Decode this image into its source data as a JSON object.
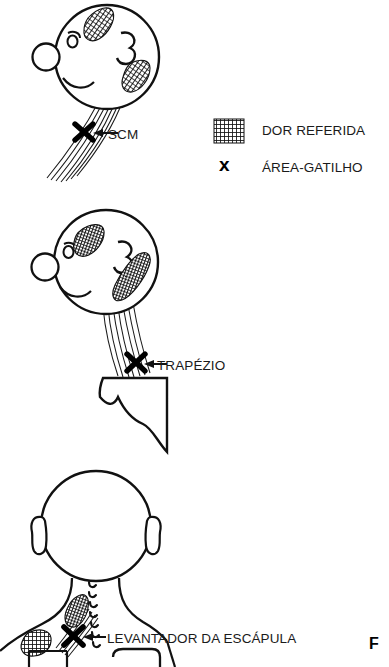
{
  "plate": {
    "letter": "F"
  },
  "legend": {
    "items": [
      {
        "marker": "hatch-swatch",
        "label": "DOR REFERIDA"
      },
      {
        "marker": "x-marker",
        "label": "ÁREA-GATILHO"
      }
    ]
  },
  "figures": [
    {
      "id": "scm",
      "label": "SCM",
      "view": "lateral-head-profile",
      "muscle": "sternocleidomastoid",
      "referred_pain_regions": 2,
      "trigger_points": 1
    },
    {
      "id": "trapezio",
      "label": "TRAPÉZIO",
      "view": "lateral-head-profile-with-shoulder",
      "muscle": "upper trapezius",
      "referred_pain_regions": 2,
      "trigger_points": 1
    },
    {
      "id": "levantador-da-escapula",
      "label": "LEVANTADOR DA ESCÁPULA",
      "view": "posterior-head-and-neck",
      "muscle": "levator scapulae",
      "referred_pain_regions": 2,
      "trigger_points": 1
    }
  ],
  "colors": {
    "ink": "#1a1a1a",
    "stroke": "#111111",
    "background": "#ffffff",
    "pain_fill": "#222222"
  }
}
